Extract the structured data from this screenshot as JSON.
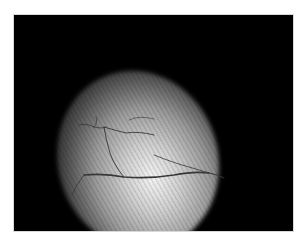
{
  "image": {
    "description": "Grayscale fundus-style medical photograph with bright elliptical illuminated region and dark branching vessels on a black background, thin white margin",
    "colors": {
      "background": "#000000",
      "margin": "#ffffff",
      "highlight": "#f4f4f4",
      "vessel": "#3a3a3a"
    }
  }
}
